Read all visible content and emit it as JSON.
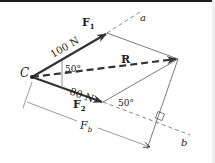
{
  "diagram": {
    "point_label": "C",
    "force1": {
      "symbol": "F",
      "subscript": "1",
      "magnitude": "100 N"
    },
    "force2": {
      "symbol": "F",
      "subscript": "2",
      "magnitude": "80 N"
    },
    "resultant": {
      "symbol": "R"
    },
    "angle_at_C": "50°",
    "angle_at_F2": "50°",
    "axis_a": "a",
    "axis_b": "b",
    "component": {
      "symbol": "F",
      "subscript": "b"
    },
    "colors": {
      "stroke": "#333333",
      "text": "#222222"
    }
  }
}
